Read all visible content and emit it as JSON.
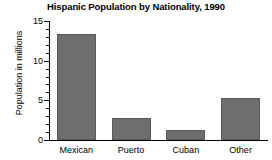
{
  "chart_data": {
    "type": "bar",
    "title": "Hispanic Population by Nationality, 1990",
    "xlabel": "",
    "ylabel": "Population in millions",
    "categories": [
      "Mexican",
      "Puerto",
      "Cuban",
      "Other"
    ],
    "values": [
      13.4,
      2.8,
      1.3,
      5.3
    ],
    "ylim": [
      0,
      15
    ],
    "ytick_labels": [
      "0",
      "5",
      "10",
      "15"
    ],
    "ytick_values": [
      0,
      5,
      10,
      15
    ],
    "minor_tick_step": 1,
    "grid": false,
    "legend": null,
    "bar_color": "#6e6e6e",
    "axis_color": "#000000",
    "background": "#ffffff"
  }
}
